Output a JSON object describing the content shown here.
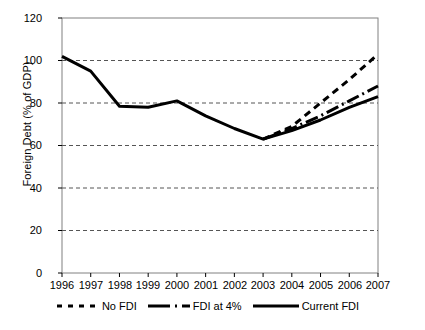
{
  "chart_data": {
    "type": "line",
    "title": "",
    "xlabel": "",
    "ylabel": "Foreign Debt (% of GDP)",
    "x": [
      1996,
      1997,
      1998,
      1999,
      2000,
      2001,
      2002,
      2003,
      2004,
      2005,
      2006,
      2007
    ],
    "categories": [
      "1996",
      "1997",
      "1998",
      "1999",
      "2000",
      "2001",
      "2002",
      "2003",
      "2004",
      "2005",
      "2006",
      "2007"
    ],
    "xlim": [
      1996,
      2007
    ],
    "ylim": [
      0,
      120
    ],
    "yticks": [
      0,
      20,
      40,
      60,
      80,
      100,
      120
    ],
    "ytick_labels": [
      "0",
      "20",
      "40",
      "60",
      "80",
      "100",
      "120"
    ],
    "grid": "horizontal-dashed",
    "legend_position": "bottom",
    "series": [
      {
        "name": "No FDI",
        "style": "dotted",
        "color": "#000000",
        "x": [
          2003,
          2004,
          2005,
          2006,
          2007
        ],
        "values": [
          63,
          69,
          80,
          91,
          103
        ]
      },
      {
        "name": "FDI at 4%",
        "style": "dash-dot",
        "color": "#000000",
        "x": [
          2003,
          2004,
          2005,
          2006,
          2007
        ],
        "values": [
          63,
          68,
          74,
          81,
          88
        ]
      },
      {
        "name": "Current FDI",
        "style": "solid",
        "color": "#000000",
        "x": [
          1996,
          1997,
          1998,
          1999,
          2000,
          2001,
          2002,
          2003,
          2004,
          2005,
          2006,
          2007
        ],
        "values": [
          102,
          95,
          78.5,
          78,
          81,
          74,
          68,
          63,
          67,
          72,
          78,
          83
        ]
      }
    ]
  },
  "axis": {
    "y_label": "Foreign Debt (% of GDP)",
    "y_ticks": [
      "120",
      "100",
      "80",
      "60",
      "40",
      "20",
      "0"
    ],
    "x_ticks": [
      "1996",
      "1997",
      "1998",
      "1999",
      "2000",
      "2001",
      "2002",
      "2003",
      "2004",
      "2005",
      "2006",
      "2007"
    ]
  },
  "legend": {
    "items": [
      {
        "label": "No FDI",
        "swatch": "dotted-line-swatch"
      },
      {
        "label": "FDI at 4%",
        "swatch": "dash-dot-line-swatch"
      },
      {
        "label": "Current FDI",
        "swatch": "solid-line-swatch"
      }
    ]
  },
  "colors": {
    "line": "#000000",
    "grid": "#555555",
    "frame": "#808080",
    "background": "#ffffff"
  }
}
